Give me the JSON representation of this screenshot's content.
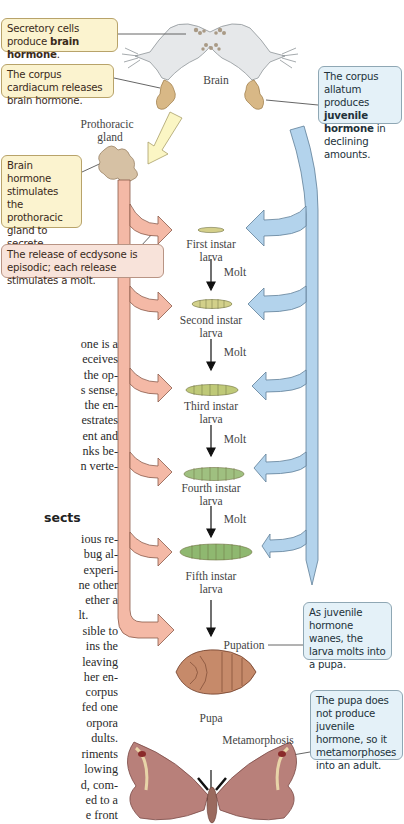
{
  "callouts": {
    "secretory": {
      "text": "Secretory cells produce ",
      "bold": "brain hormone",
      "tail": "."
    },
    "cardiacum": {
      "text": "The corpus cardiacum releases brain hormone."
    },
    "allatum": {
      "text": "The corpus allatum produces ",
      "bold": "juvenile hormone",
      "tail": " in declining amounts."
    },
    "brain_hormone": {
      "text": "Brain hormone stimulates the prothoracic gland to secrete ",
      "bold": "ecdysone",
      "tail": "."
    },
    "episodic": {
      "text": "The release of ecdysone is episodic; each release stimulates a molt."
    },
    "pupation_note": {
      "text": "As juvenile hormone wanes, the larva molts into a pupa."
    },
    "pupa_note": {
      "text": "The pupa does not produce juvenile hormone, so it metamorphoses into an adult."
    }
  },
  "labels": {
    "brain": "Brain",
    "prothoracic_gland_1": "Prothoracic",
    "prothoracic_gland_2": "gland",
    "stages": [
      {
        "line1": "First instar",
        "line2": "larva"
      },
      {
        "line1": "Second instar",
        "line2": "larva"
      },
      {
        "line1": "Third instar",
        "line2": "larva"
      },
      {
        "line1": "Fourth instar",
        "line2": "larva"
      },
      {
        "line1": "Fifth instar",
        "line2": "larva"
      }
    ],
    "molt": "Molt",
    "pupation": "Pupation",
    "pupa": "Pupa",
    "metamorphosis": "Metamorphosis"
  },
  "body_text": {
    "para1": [
      "one is a",
      "eceives",
      "the op-",
      "s sense,",
      "the en-",
      "estrates",
      "ent and",
      "nks be-",
      "n verte-"
    ],
    "heading": "sects",
    "para2": [
      "ious re-",
      "bug al-",
      "experi-",
      "ne other",
      "ether a",
      "lt."
    ],
    "para3": [
      "sible to",
      "ins the",
      "leaving",
      "her en-",
      "corpus",
      "fed one",
      "orpora",
      "dults."
    ],
    "para4": [
      "riments",
      "lowing",
      "d, com-",
      "ed to a",
      "e front"
    ]
  },
  "colors": {
    "ecdysone_arrow": "#f4b9a6",
    "ecdysone_stroke": "#8a5a4a",
    "juvenile_arrow": "#b3d3ec",
    "juvenile_stroke": "#5f7f98",
    "brain_hormone_arrow": "#fbf6c4",
    "callout_yellow": "#fbf3cf",
    "callout_pink": "#f8e3da",
    "callout_blue": "#e4f1f8"
  }
}
